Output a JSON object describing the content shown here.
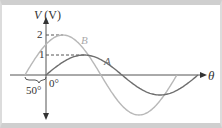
{
  "diagram": {
    "y_axis_label_var": "V",
    "y_axis_label_unit": "(V)",
    "x_axis_label": "θ",
    "tick_2": "2",
    "tick_1": "1",
    "origin_label": "0°",
    "phase_label": "50°",
    "curve_a_label": "A",
    "curve_b_label": "B",
    "curves": [
      {
        "name": "A",
        "amplitude": 1,
        "phase_deg": 0,
        "color": "#6e6e6e"
      },
      {
        "name": "B",
        "amplitude": 2,
        "phase_deg": 50,
        "color": "#b8b8b8"
      }
    ]
  }
}
